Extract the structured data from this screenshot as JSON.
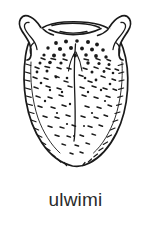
{
  "figure": {
    "caption": "ulwimi",
    "style": "black-and-white line drawing",
    "background_color": "#ffffff",
    "ink_color": "#1a1a1a",
    "caption_color": "#2b2b2b",
    "parts": [
      {
        "name": "left-horn",
        "label": ""
      },
      {
        "name": "right-horn",
        "label": ""
      },
      {
        "name": "epiglottis-notch",
        "label": ""
      },
      {
        "name": "tongue-body",
        "label": ""
      },
      {
        "name": "median-sulcus",
        "label": ""
      },
      {
        "name": "papillae-dots",
        "label": ""
      },
      {
        "name": "edge-hatching",
        "label": ""
      }
    ]
  }
}
